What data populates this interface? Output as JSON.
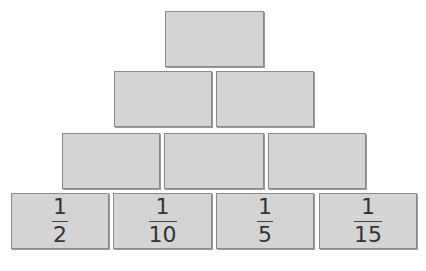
{
  "pyramid": {
    "rows": [
      {
        "bricks": [
          {
            "value": null
          }
        ]
      },
      {
        "bricks": [
          {
            "value": null
          },
          {
            "value": null
          }
        ]
      },
      {
        "bricks": [
          {
            "value": null
          },
          {
            "value": null
          },
          {
            "value": null
          }
        ]
      },
      {
        "bricks": [
          {
            "numerator": "1",
            "denominator": "2"
          },
          {
            "numerator": "1",
            "denominator": "10"
          },
          {
            "numerator": "1",
            "denominator": "5"
          },
          {
            "numerator": "1",
            "denominator": "15"
          }
        ]
      }
    ]
  }
}
